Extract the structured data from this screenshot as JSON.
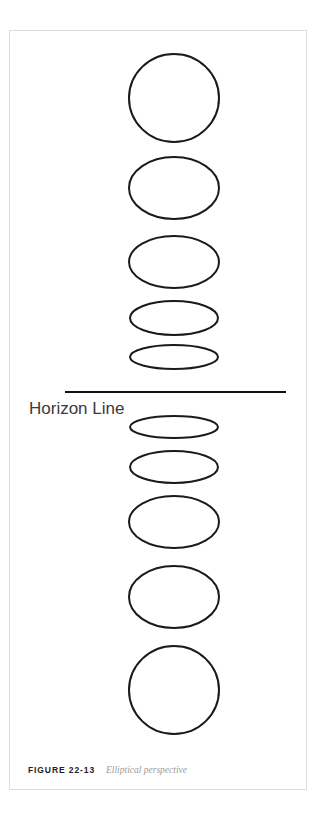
{
  "figure": {
    "caption_number": "FIGURE 22-13",
    "caption_text": "Elliptical perspective",
    "horizon_label": "Horizon Line",
    "colors": {
      "stroke": "#1a1a1a",
      "frame_border": "#dcdcdc",
      "background": "#ffffff",
      "horizon_line": "#111111",
      "caption_number": "#222222",
      "caption_text": "#9b9b9b",
      "horizon_label_text": "#3a3a3a"
    }
  },
  "chart_data": {
    "type": "diagram",
    "title": "Elliptical perspective",
    "subtitle": "FIGURE 22-13",
    "annotations": [
      {
        "name": "horizon-line",
        "label": "Horizon Line",
        "y": 361,
        "x1": 55,
        "x2": 276
      }
    ],
    "ellipses": [
      {
        "index": 1,
        "cx": 164,
        "cy": 67,
        "rx": 45,
        "ry": 44,
        "position": "above-horizon",
        "note": "farthest above horizon, appears as a full circle"
      },
      {
        "index": 2,
        "cx": 164,
        "cy": 157,
        "rx": 45,
        "ry": 31,
        "position": "above-horizon",
        "note": ""
      },
      {
        "index": 3,
        "cx": 164,
        "cy": 231,
        "rx": 45,
        "ry": 26,
        "position": "above-horizon",
        "note": ""
      },
      {
        "index": 4,
        "cx": 164,
        "cy": 287,
        "rx": 44,
        "ry": 17,
        "position": "above-horizon",
        "note": ""
      },
      {
        "index": 5,
        "cx": 164,
        "cy": 326,
        "rx": 44,
        "ry": 12,
        "position": "above-horizon",
        "note": "nearest above horizon, nearly flat"
      },
      {
        "index": 6,
        "cx": 164,
        "cy": 396,
        "rx": 44,
        "ry": 11,
        "position": "below-horizon",
        "note": "nearest below horizon, nearly flat"
      },
      {
        "index": 7,
        "cx": 164,
        "cy": 436,
        "rx": 44,
        "ry": 16,
        "position": "below-horizon",
        "note": ""
      },
      {
        "index": 8,
        "cx": 164,
        "cy": 491,
        "rx": 45,
        "ry": 26,
        "position": "below-horizon",
        "note": ""
      },
      {
        "index": 9,
        "cx": 164,
        "cy": 566,
        "rx": 45,
        "ry": 31,
        "position": "below-horizon",
        "note": ""
      },
      {
        "index": 10,
        "cx": 164,
        "cy": 659,
        "rx": 45,
        "ry": 44,
        "position": "below-horizon",
        "note": "farthest below horizon, appears as a full circle"
      }
    ],
    "xlabel": "",
    "ylabel": "",
    "grid": false,
    "legend": null
  }
}
